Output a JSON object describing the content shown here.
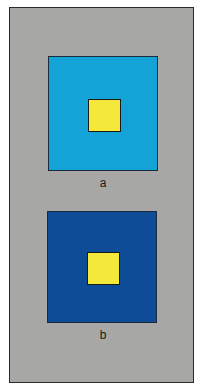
{
  "figure": {
    "background_color": "#a7a7a5",
    "panels": [
      {
        "label": "a",
        "outer_color": "#14a3d6",
        "inner_color": "#f4e83a"
      },
      {
        "label": "b",
        "outer_color": "#0f4c98",
        "inner_color": "#f4e83a"
      }
    ]
  }
}
